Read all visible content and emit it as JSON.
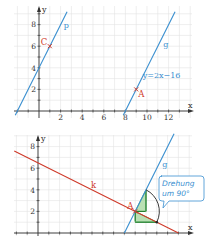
{
  "chart_data": [
    {
      "type": "line",
      "title": "",
      "xlabel": "x",
      "ylabel": "y",
      "xlim": [
        -2.3,
        14
      ],
      "ylim": [
        -0.6,
        9.2
      ],
      "xticks": [
        2,
        4,
        6,
        8,
        10,
        12
      ],
      "yticks": [
        2,
        4,
        6,
        8
      ],
      "grid": true,
      "series": [
        {
          "name": "p",
          "equation": "y=2x+4",
          "slope": 2,
          "intercept": 4,
          "color": "#3a8fd0",
          "x_range": [
            -2.2,
            2.6
          ],
          "label": "p",
          "label_at": [
            2.3,
            7.7
          ]
        },
        {
          "name": "g",
          "equation": "y=2x-16",
          "slope": 2,
          "intercept": -16,
          "color": "#3a8fd0",
          "x_range": [
            7.8,
            12.6
          ],
          "label": "g",
          "label_at": [
            11.5,
            5.9
          ]
        }
      ],
      "points": [
        {
          "name": "C",
          "x": 1,
          "y": 6,
          "color": "#cf3a2a"
        },
        {
          "name": "A",
          "x": 9,
          "y": 2,
          "color": "#cf3a2a"
        }
      ],
      "annotations": [
        {
          "text": "y=2x−16",
          "x": 9.6,
          "y": 3.1,
          "color": "#3a8fd0"
        }
      ]
    },
    {
      "type": "line",
      "title": "",
      "xlabel": "x",
      "ylabel": "y",
      "xlim": [
        -2.3,
        14
      ],
      "ylim": [
        0,
        9.2
      ],
      "xticks": [],
      "yticks": [
        2,
        4,
        6,
        8
      ],
      "grid": true,
      "series": [
        {
          "name": "k",
          "equation": "y=-0.5x+6.5",
          "slope": -0.5,
          "intercept": 6.5,
          "color": "#cf3a2a",
          "x_range": [
            -2.2,
            13
          ],
          "label": "k",
          "label_at": [
            4.9,
            4.2
          ]
        },
        {
          "name": "g",
          "equation": "y=2x-16",
          "slope": 2,
          "intercept": -16,
          "color": "#3a8fd0",
          "x_range": [
            8,
            12.6
          ],
          "label": "g",
          "label_at": [
            11.5,
            6.1
          ]
        }
      ],
      "points": [
        {
          "name": "A",
          "x": 9,
          "y": 2,
          "color": "#cf3a2a"
        }
      ],
      "slope_triangles": [
        {
          "vertices": [
            [
              9,
              2
            ],
            [
              10,
              2
            ],
            [
              10,
              4
            ]
          ],
          "color": "#4caf50"
        },
        {
          "vertices": [
            [
              9,
              2
            ],
            [
              9,
              1
            ],
            [
              11,
              1
            ]
          ],
          "color": "#4caf50"
        }
      ],
      "rotation_arc": {
        "from": [
          10,
          4
        ],
        "to": [
          11,
          1
        ],
        "center": [
          9,
          2
        ]
      },
      "callout": {
        "line1": "Drehung",
        "line2": "um 90°",
        "color": "#3a8fd0"
      }
    }
  ]
}
